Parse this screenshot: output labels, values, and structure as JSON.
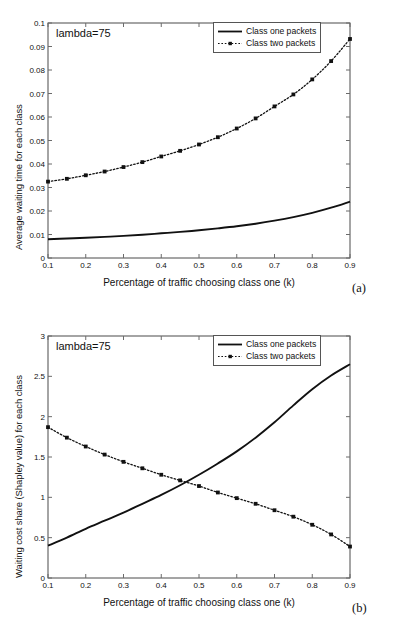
{
  "figure": {
    "panels": [
      {
        "id": "a",
        "caption": "(a)",
        "annotation": "lambda=75",
        "legend": [
          {
            "label": "Class one packets",
            "style": "solid"
          },
          {
            "label": "Class two packets",
            "style": "dotted-marker"
          }
        ],
        "chart_data": {
          "type": "line",
          "title": "",
          "xlabel": "Percentage of traffic choosing class one (k)",
          "ylabel": "Average waiting time for each class",
          "xlim": [
            0.1,
            0.9
          ],
          "ylim": [
            0,
            0.1
          ],
          "xticks": [
            "0.1",
            "0.2",
            "0.3",
            "0.4",
            "0.5",
            "0.6",
            "0.7",
            "0.8",
            "0.9"
          ],
          "yticks": [
            "0",
            "0.01",
            "0.02",
            "0.03",
            "0.04",
            "0.05",
            "0.06",
            "0.07",
            "0.08",
            "0.09",
            "0.1"
          ],
          "grid": false,
          "legend_position": "top-right",
          "x": [
            0.1,
            0.15,
            0.2,
            0.25,
            0.3,
            0.35,
            0.4,
            0.45,
            0.5,
            0.55,
            0.6,
            0.65,
            0.7,
            0.75,
            0.8,
            0.85,
            0.9
          ],
          "series": [
            {
              "name": "Class one packets",
              "style": "solid",
              "markers": false,
              "values": [
                0.008,
                0.0083,
                0.0086,
                0.009,
                0.0094,
                0.0099,
                0.0105,
                0.0111,
                0.0118,
                0.0126,
                0.0135,
                0.0146,
                0.0159,
                0.0174,
                0.0192,
                0.0214,
                0.024
              ]
            },
            {
              "name": "Class two packets",
              "style": "dotted",
              "markers": true,
              "values": [
                0.0325,
                0.0337,
                0.0352,
                0.0368,
                0.0387,
                0.0408,
                0.0432,
                0.0456,
                0.0483,
                0.0514,
                0.0551,
                0.0594,
                0.0645,
                0.0696,
                0.076,
                0.0838,
                0.0932
              ]
            }
          ]
        }
      },
      {
        "id": "b",
        "caption": "(b)",
        "annotation": "lambda=75",
        "legend": [
          {
            "label": "Class one packets",
            "style": "solid"
          },
          {
            "label": "Class two packets",
            "style": "dotted-marker"
          }
        ],
        "chart_data": {
          "type": "line",
          "title": "",
          "xlabel": "Percentage of traffic choosing class one (k)",
          "ylabel": "Waiting cost share (Shapley value) for each class",
          "xlim": [
            0.1,
            0.9
          ],
          "ylim": [
            0,
            3
          ],
          "xticks": [
            "0.1",
            "0.2",
            "0.3",
            "0.4",
            "0.5",
            "0.6",
            "0.7",
            "0.8",
            "0.9"
          ],
          "yticks": [
            "0",
            "0.5",
            "1",
            "1.5",
            "2",
            "2.5",
            "3"
          ],
          "grid": false,
          "legend_position": "top-right",
          "x": [
            0.1,
            0.15,
            0.2,
            0.25,
            0.3,
            0.35,
            0.4,
            0.45,
            0.5,
            0.55,
            0.6,
            0.65,
            0.7,
            0.75,
            0.8,
            0.85,
            0.9
          ],
          "series": [
            {
              "name": "Class one packets",
              "style": "solid",
              "markers": false,
              "values": [
                0.4,
                0.5,
                0.61,
                0.71,
                0.81,
                0.92,
                1.03,
                1.15,
                1.28,
                1.42,
                1.57,
                1.74,
                1.93,
                2.14,
                2.34,
                2.51,
                2.65
              ]
            },
            {
              "name": "Class two packets",
              "style": "dotted",
              "markers": true,
              "values": [
                1.87,
                1.74,
                1.63,
                1.53,
                1.44,
                1.36,
                1.28,
                1.21,
                1.14,
                1.06,
                0.99,
                0.92,
                0.84,
                0.76,
                0.66,
                0.54,
                0.39
              ]
            }
          ]
        }
      }
    ]
  }
}
